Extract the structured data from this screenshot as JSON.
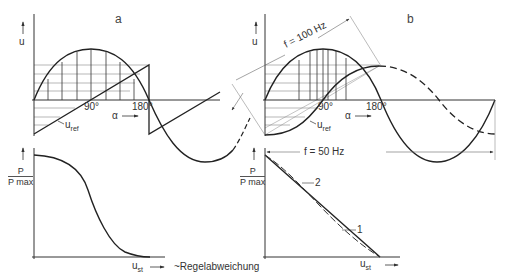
{
  "panels": {
    "a": {
      "letter": "a",
      "y_axis_label": "u",
      "x_axis_label": "α",
      "tick_90": "90°",
      "tick_180": "180°",
      "ref_label": "u",
      "ref_sub": "ref",
      "lower": {
        "y_label_num": "P",
        "y_label_den": "P max",
        "x_label": "u",
        "x_sub": "st",
        "note": "~Regelabweichung"
      }
    },
    "b": {
      "letter": "b",
      "y_axis_label": "u",
      "x_axis_label": "α",
      "tick_90": "90°",
      "tick_180": "180°",
      "ref_label": "u",
      "ref_sub": "ref",
      "freq_100": "f = 100 Hz",
      "freq_50": "f = 50 Hz",
      "lower": {
        "y_label_num": "P",
        "y_label_den": "P max",
        "x_label": "u",
        "x_sub": "st",
        "curve_1": "1",
        "curve_2": "2"
      }
    }
  },
  "colors": {
    "line": "#2a2a2a",
    "thin": "#555555",
    "hatch": "#777777"
  }
}
